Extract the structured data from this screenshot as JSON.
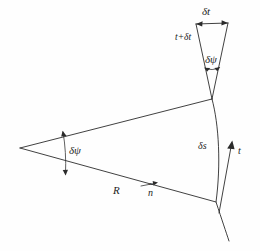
{
  "figure": {
    "background_color": "#fefefe",
    "ink_color": "#2b2b2b",
    "width": 260,
    "height": 251
  },
  "labels": {
    "delta_t": "δt",
    "t_plus_delta_t": "t+δt",
    "delta_psi_top": "δψ",
    "delta_psi_left": "δψ",
    "radius": "R",
    "normal_vector": "n",
    "normal_vector_hat": "ˆ",
    "delta_s": "δs",
    "tangent_vector": "t"
  },
  "geometry": {
    "center_of_curvature": [
      20,
      148
    ],
    "curve_top_point": [
      212,
      99
    ],
    "curve_bottom_point": [
      216,
      202
    ],
    "upper_triangle_apex": [
      212,
      99
    ],
    "upper_triangle_left_top": [
      196,
      24
    ],
    "upper_triangle_right_top": [
      228,
      23
    ],
    "tangent_arrow_tip": [
      232,
      142
    ],
    "tangent_arrow_tail": [
      219,
      213
    ],
    "normal_arrow_tip": [
      157,
      183
    ],
    "normal_arrow_tail": [
      143,
      186
    ]
  },
  "icons": {
    "arrowhead": "arrowhead-icon",
    "angle_arc": "angle-arc-icon"
  }
}
